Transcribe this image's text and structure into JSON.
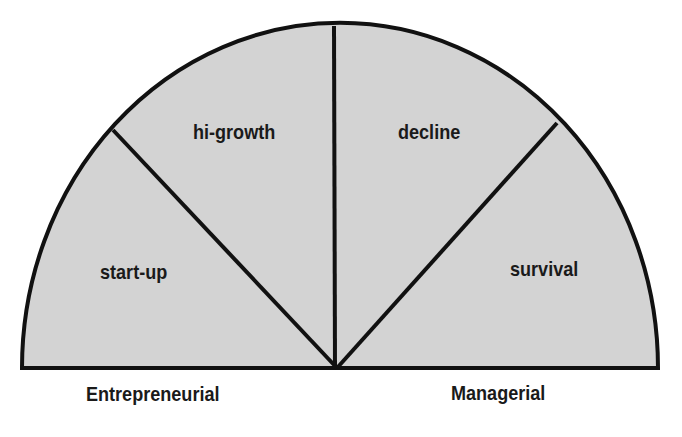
{
  "diagram": {
    "type": "semicircle-stages",
    "segments": [
      {
        "label": "start-up"
      },
      {
        "label": "hi-growth"
      },
      {
        "label": "decline"
      },
      {
        "label": "survival"
      }
    ],
    "axis_labels": {
      "left": "Entrepreneurial",
      "right": "Managerial"
    },
    "colors": {
      "fill": "#d3d3d3",
      "stroke": "#111111",
      "background": "#ffffff"
    }
  }
}
